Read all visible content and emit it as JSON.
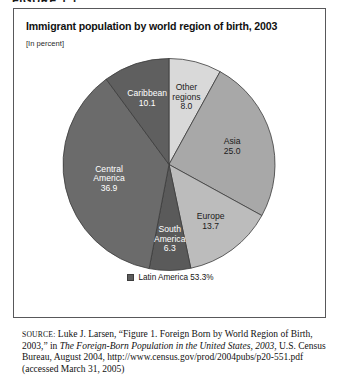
{
  "figure_number": "FIGURE 1.1",
  "figure": {
    "title": "Immigrant population by world region of birth, 2003",
    "subtitle": "[In percent]"
  },
  "legend": {
    "label": "Latin America 53.3%",
    "swatch_color": "#5d5d5d"
  },
  "source": {
    "label": "source:",
    "text_1": " Luke J. Larsen, “Figure 1. Foreign Born by World Region of Birth, 2003,” in ",
    "italic_1": "The Foreign-Born Population in the United States, 2003",
    "text_2": ", U.S. Census Bureau, August 2004, http://www.census.gov/prod/2004pubs/p20-551.pdf (accessed March 31, 2005)"
  },
  "chart_data": {
    "type": "pie",
    "title": "Immigrant population by world region of birth, 2003",
    "subtitle": "[In percent]",
    "units": "percent",
    "start_angle_deg": 0,
    "direction": "clockwise",
    "grid": false,
    "legend_position": "bottom-center",
    "legend_entries": [
      "Latin America 53.3%"
    ],
    "annotations": [
      "Latin America 53.3%"
    ],
    "categories": [
      "Other regions",
      "Asia",
      "Europe",
      "South America",
      "Central America",
      "Caribbean"
    ],
    "values": [
      8.0,
      25.0,
      13.7,
      6.3,
      36.9,
      10.1
    ],
    "slices": [
      {
        "name": "Other regions",
        "label_line_1": "Other",
        "label_line_2": "regions",
        "value": "8.0",
        "numeric": 8.0,
        "color": "#d9d9d9",
        "text_tone": "light-bg"
      },
      {
        "name": "Asia",
        "label_line_1": "Asia",
        "label_line_2": "",
        "value": "25.0",
        "numeric": 25.0,
        "color": "#a8a8a8",
        "text_tone": "light-bg"
      },
      {
        "name": "Europe",
        "label_line_1": "Europe",
        "label_line_2": "",
        "value": "13.7",
        "numeric": 13.7,
        "color": "#bcbcbc",
        "text_tone": "light-bg"
      },
      {
        "name": "South America",
        "label_line_1": "South",
        "label_line_2": "America",
        "value": "6.3",
        "numeric": 6.3,
        "color": "#5a5a5a",
        "text_tone": "dark-bg"
      },
      {
        "name": "Central America",
        "label_line_1": "Central",
        "label_line_2": "America",
        "value": "36.9",
        "numeric": 36.9,
        "color": "#6b6b6b",
        "text_tone": "dark-bg"
      },
      {
        "name": "Caribbean",
        "label_line_1": "Caribbean",
        "label_line_2": "",
        "value": "10.1",
        "numeric": 10.1,
        "color": "#5f5f5f",
        "text_tone": "dark-bg"
      }
    ]
  }
}
